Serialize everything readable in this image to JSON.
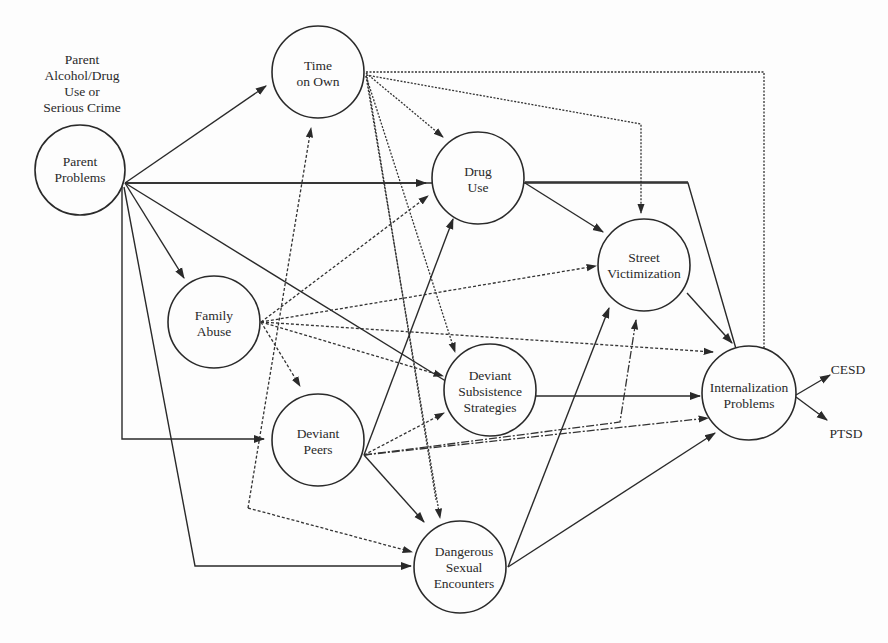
{
  "diagram": {
    "type": "path-model",
    "annotation": {
      "lines": [
        "Parent",
        "Alcohol/Drug",
        "Use or",
        "Serious Crime"
      ]
    },
    "nodes": {
      "parent_problems": {
        "lines": [
          "Parent",
          "Problems"
        ]
      },
      "time_on_own": {
        "lines": [
          "Time",
          "on Own"
        ]
      },
      "drug_use": {
        "lines": [
          "Drug",
          "Use"
        ]
      },
      "street_victimization": {
        "lines": [
          "Street",
          "Victimization"
        ]
      },
      "family_abuse": {
        "lines": [
          "Family",
          "Abuse"
        ]
      },
      "deviant_subsistence": {
        "lines": [
          "Deviant",
          "Subsistence",
          "Strategies"
        ]
      },
      "deviant_peers": {
        "lines": [
          "Deviant",
          "Peers"
        ]
      },
      "dangerous_sexual": {
        "lines": [
          "Dangerous",
          "Sexual",
          "Encounters"
        ]
      },
      "internalization": {
        "lines": [
          "Internalization",
          "Problems"
        ]
      }
    },
    "indicators": {
      "cesd": "CESD",
      "ptsd": "PTSD"
    },
    "edges": [
      {
        "from": "Parent Problems",
        "to": "Time on Own",
        "style": "solid"
      },
      {
        "from": "Parent Problems",
        "to": "Drug Use",
        "style": "solid"
      },
      {
        "from": "Parent Problems",
        "to": "Internalization Problems",
        "style": "solid"
      },
      {
        "from": "Parent Problems",
        "to": "Family Abuse",
        "style": "solid"
      },
      {
        "from": "Parent Problems",
        "to": "Deviant Subsistence Strategies",
        "style": "solid"
      },
      {
        "from": "Parent Problems",
        "to": "Deviant Peers",
        "style": "solid"
      },
      {
        "from": "Parent Problems",
        "to": "Dangerous Sexual Encounters",
        "style": "solid"
      },
      {
        "from": "Time on Own",
        "to": "Drug Use",
        "style": "dotted"
      },
      {
        "from": "Time on Own",
        "to": "Street Victimization",
        "style": "dotted"
      },
      {
        "from": "Time on Own",
        "to": "Internalization Problems",
        "style": "dotted"
      },
      {
        "from": "Time on Own",
        "to": "Deviant Subsistence Strategies",
        "style": "dotted"
      },
      {
        "from": "Time on Own",
        "to": "Dangerous Sexual Encounters",
        "style": "dotted"
      },
      {
        "from": "Drug Use",
        "to": "Street Victimization",
        "style": "solid"
      },
      {
        "from": "Drug Use",
        "to": "Internalization Problems",
        "style": "solid"
      },
      {
        "from": "Street Victimization",
        "to": "Internalization Problems",
        "style": "solid"
      },
      {
        "from": "Family Abuse",
        "to": "Drug Use",
        "style": "dashed"
      },
      {
        "from": "Family Abuse",
        "to": "Street Victimization",
        "style": "dashed"
      },
      {
        "from": "Family Abuse",
        "to": "Internalization Problems",
        "style": "dashed"
      },
      {
        "from": "Family Abuse",
        "to": "Deviant Subsistence Strategies",
        "style": "dashed"
      },
      {
        "from": "Family Abuse",
        "to": "Deviant Peers",
        "style": "dashed"
      },
      {
        "from": "Family Abuse",
        "to": "Time on Own",
        "style": "dashed"
      },
      {
        "from": "Family Abuse",
        "to": "Dangerous Sexual Encounters",
        "style": "dashed"
      },
      {
        "from": "Deviant Subsistence Strategies",
        "to": "Internalization Problems",
        "style": "solid"
      },
      {
        "from": "Deviant Peers",
        "to": "Drug Use",
        "style": "solid"
      },
      {
        "from": "Deviant Peers",
        "to": "Deviant Subsistence Strategies",
        "style": "dashed"
      },
      {
        "from": "Deviant Peers",
        "to": "Street Victimization",
        "style": "dash-dot"
      },
      {
        "from": "Deviant Peers",
        "to": "Internalization Problems",
        "style": "dash-dot"
      },
      {
        "from": "Deviant Peers",
        "to": "Dangerous Sexual Encounters",
        "style": "solid"
      },
      {
        "from": "Dangerous Sexual Encounters",
        "to": "Street Victimization",
        "style": "solid"
      },
      {
        "from": "Dangerous Sexual Encounters",
        "to": "Internalization Problems",
        "style": "solid"
      },
      {
        "from": "Internalization Problems",
        "to": "CESD",
        "style": "solid"
      },
      {
        "from": "Internalization Problems",
        "to": "PTSD",
        "style": "solid"
      }
    ]
  }
}
